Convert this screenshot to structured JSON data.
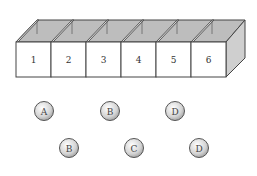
{
  "diagram": {
    "boxes": [
      {
        "label": "1"
      },
      {
        "label": "2"
      },
      {
        "label": "3"
      },
      {
        "label": "4"
      },
      {
        "label": "5"
      },
      {
        "label": "6"
      }
    ],
    "balls_row1": [
      {
        "label": "A"
      },
      {
        "label": "B"
      },
      {
        "label": "D"
      }
    ],
    "balls_row2": [
      {
        "label": "B"
      },
      {
        "label": "C"
      },
      {
        "label": "D"
      }
    ],
    "colors": {
      "box_front": "#ffffff",
      "box_inner": "#b8b8b8",
      "box_side": "#cfcfcf",
      "outline": "#444444",
      "ball_fill": "#d8d8d8"
    }
  }
}
